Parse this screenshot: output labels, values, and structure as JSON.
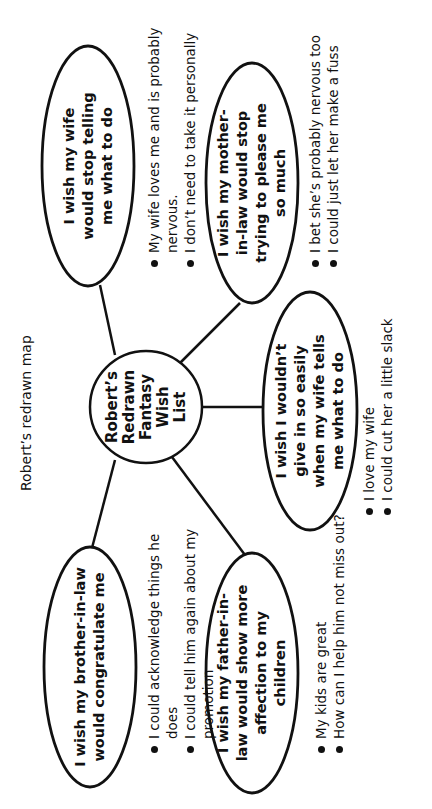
{
  "title": "Robert’s redrawn map",
  "center": {
    "lines": [
      "Robert’s",
      "Redrawn",
      "Fantasy",
      "Wish",
      "List"
    ]
  },
  "nodes": [
    {
      "id": "wife",
      "text": "I wish my wife would stop telling me what to do",
      "notes": [
        "My wife loves me and is probably nervous.",
        "I don’t need to take it personally"
      ]
    },
    {
      "id": "mother-in-law",
      "text": "I wish my mother-in-law would stop trying to please me so much",
      "notes": [
        "I bet she’s probably nervous too",
        "I could just let her make a fuss"
      ]
    },
    {
      "id": "give-in",
      "text": "I wish I wouldn’t give in so easily when my wife tells me what to do",
      "notes": [
        "I love my wife",
        "I could cut her a little slack"
      ]
    },
    {
      "id": "brother-in-law",
      "text": "I wish my brother-in-law would congratulate me",
      "notes": [
        "I could acknowledge things he does",
        "I could tell him again about my promotion"
      ]
    },
    {
      "id": "father-in-law",
      "text": "I wish my father-in-law would show more affection to my children",
      "notes": [
        "My kids are great",
        "How can I help him not miss out?"
      ]
    }
  ],
  "colors": {
    "stroke": "#111111",
    "background": "#ffffff"
  }
}
